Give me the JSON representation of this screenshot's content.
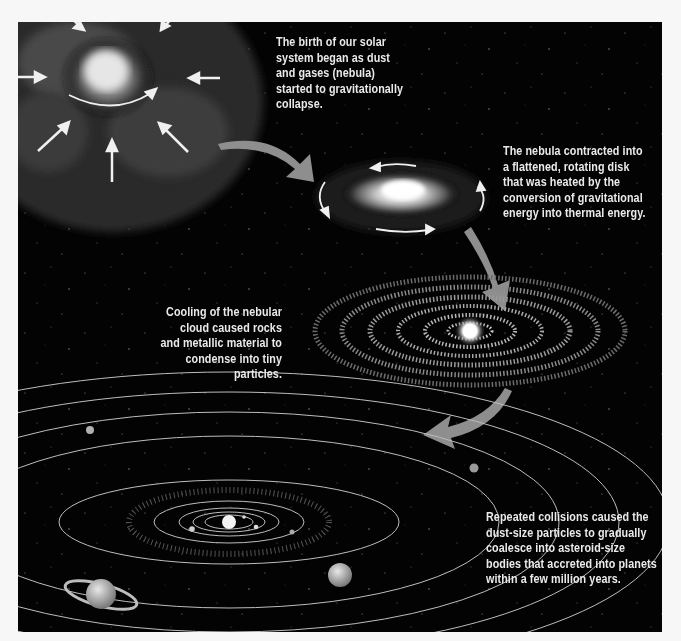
{
  "figure": {
    "stages": [
      {
        "id": "nebula-collapse",
        "caption": "The birth of our solar\nsystem began as dust\nand gases (nebula)\nstarted to gravitationally\ncollapse."
      },
      {
        "id": "rotating-disk",
        "caption": "The nebula contracted into\na flattened, rotating disk\nthat was heated by the\nconversion of gravitational\nenergy into thermal energy."
      },
      {
        "id": "condensation",
        "caption": "Cooling of the nebular\ncloud caused rocks\nand metallic material to\ncondense into tiny\nparticles."
      },
      {
        "id": "accretion",
        "caption": "Repeated collisions caused the\ndust-size particles to gradually\ncoalesce into asteroid-size\nbodies that accreted into planets\nwithin a few million years."
      }
    ]
  },
  "colors": {
    "background": "#030303",
    "page": "#f7f7f7",
    "text": "#eaeaea",
    "flow_arrow": "#9a9a9a",
    "orbit": "#bdbdbd"
  }
}
